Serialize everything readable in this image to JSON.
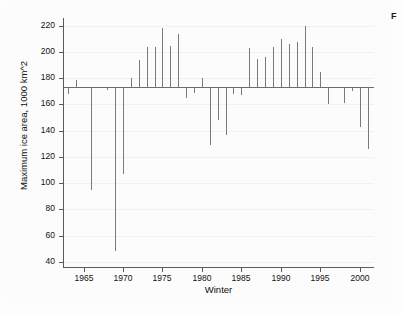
{
  "caption": {
    "fragment": "F"
  },
  "chart_data": {
    "type": "bar",
    "title": "",
    "subtitle": "",
    "xlabel": "Winter",
    "ylabel": "Maximum ice area, 1000 km^2",
    "xlim": [
      1962.4,
      2001.8
    ],
    "ylim": [
      36,
      226
    ],
    "ytick_values": [
      40,
      60,
      80,
      100,
      120,
      140,
      160,
      180,
      200,
      220
    ],
    "ytick_labels": [
      "40",
      "60",
      "80",
      "100",
      "120",
      "140",
      "160",
      "180",
      "200",
      "220"
    ],
    "xtick_values": [
      1965,
      1970,
      1975,
      1980,
      1985,
      1990,
      1995,
      2000
    ],
    "xtick_labels": [
      "1965",
      "1970",
      "1975",
      "1980",
      "1985",
      "1990",
      "1995",
      "2000"
    ],
    "grid": true,
    "legend": "none",
    "baseline": 173,
    "baseline_note": "Mean maximum ice area reference line; spikes drawn as deviations from this value",
    "series_name": "Maximum ice area",
    "bar_color": "#7a7a7a",
    "categories": [
      1963,
      1964,
      1965,
      1966,
      1967,
      1968,
      1969,
      1970,
      1971,
      1972,
      1973,
      1974,
      1975,
      1976,
      1977,
      1978,
      1979,
      1980,
      1981,
      1982,
      1983,
      1984,
      1985,
      1986,
      1987,
      1988,
      1989,
      1990,
      1991,
      1992,
      1993,
      1994,
      1995,
      1996,
      1997,
      1998,
      1999,
      2000,
      2001
    ],
    "values": [
      168,
      179,
      173,
      95,
      173,
      171,
      48,
      107,
      180,
      194,
      204,
      204,
      218,
      205,
      214,
      165,
      169,
      180,
      129,
      148,
      137,
      168,
      167,
      203,
      195,
      196,
      204,
      210,
      206,
      208,
      220,
      204,
      185,
      160,
      173,
      161,
      170,
      143,
      126
    ]
  },
  "colors": {
    "axis": "#5b5b5b",
    "baseline": "#6e6e6e",
    "bar": "#7a7a7a",
    "grid": "#f1f1f1",
    "text": "#111111",
    "background": "#fdfdfd"
  }
}
